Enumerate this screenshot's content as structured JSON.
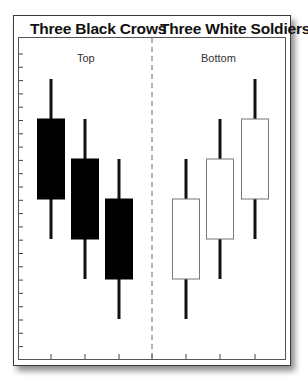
{
  "panels": {
    "left": {
      "title": "Three Black Crows",
      "position_label": "Top"
    },
    "right": {
      "title": "Three White Soldiers",
      "position_label": "Bottom"
    }
  },
  "colors": {
    "bearish_body": "#000000",
    "bullish_body": "#ffffff",
    "wick": "#111111",
    "frame": "#3a3a3a",
    "divider": "#666666"
  },
  "chart_data": {
    "type": "candlestick",
    "xlabel": "",
    "ylabel": "",
    "grid": false,
    "axis_tick_labels": "none shown",
    "divider": "dashed vertical line between the two patterns",
    "series": [
      {
        "name": "Three Black Crows",
        "annotation": "Top",
        "candles": [
          {
            "index": 1,
            "open": 6.0,
            "high": 7.0,
            "low": 3.0,
            "close": 4.0,
            "color": "black"
          },
          {
            "index": 2,
            "open": 5.0,
            "high": 6.0,
            "low": 2.0,
            "close": 3.0,
            "color": "black"
          },
          {
            "index": 3,
            "open": 4.0,
            "high": 5.0,
            "low": 1.0,
            "close": 2.0,
            "color": "black"
          }
        ]
      },
      {
        "name": "Three White Soldiers",
        "annotation": "Bottom",
        "candles": [
          {
            "index": 1,
            "open": 2.0,
            "high": 5.0,
            "low": 1.0,
            "close": 4.0,
            "color": "white"
          },
          {
            "index": 2,
            "open": 3.0,
            "high": 6.0,
            "low": 2.0,
            "close": 5.0,
            "color": "white"
          },
          {
            "index": 3,
            "open": 4.0,
            "high": 7.0,
            "low": 3.0,
            "close": 6.0,
            "color": "white"
          }
        ]
      }
    ],
    "ylim": [
      0,
      8
    ]
  }
}
